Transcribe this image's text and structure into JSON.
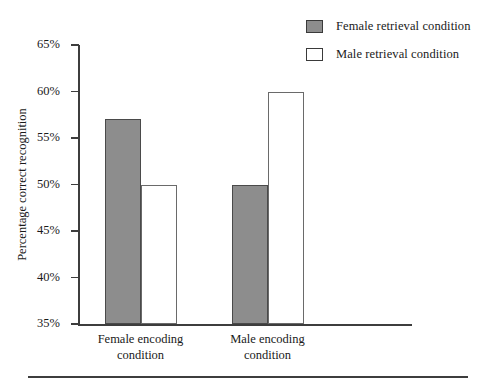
{
  "chart_data": {
    "type": "bar",
    "title": "",
    "xlabel": "",
    "ylabel": "Percentage correct recognition",
    "categories": [
      "Female encoding condition",
      "Male encoding condition"
    ],
    "category_lines": [
      [
        "Female encoding",
        "condition"
      ],
      [
        "Male encoding",
        "condition"
      ]
    ],
    "series": [
      {
        "name": "Female retrieval condition",
        "values": [
          57,
          50
        ],
        "color": "#8d8d8d"
      },
      {
        "name": "Male retrieval condition",
        "values": [
          50,
          60
        ],
        "color": "#ffffff"
      }
    ],
    "ylim": [
      35,
      65
    ],
    "ytick_values": [
      65,
      60,
      55,
      50,
      45,
      40,
      35
    ],
    "ytick_labels": [
      "65%",
      "60%",
      "55%",
      "50%",
      "45%",
      "40%",
      "35%"
    ],
    "grid": false,
    "legend_position": "top-right",
    "value_unit": "%"
  },
  "legend": {
    "items": [
      {
        "label": "Female retrieval condition",
        "swatch": "filled-gray-square"
      },
      {
        "label": "Male retrieval condition",
        "swatch": "hollow-white-square"
      }
    ]
  },
  "axes": {
    "y_title": "Percentage correct recognition",
    "y_ticks": [
      "65%",
      "60%",
      "55%",
      "50%",
      "45%",
      "40%",
      "35%"
    ],
    "x_groups": [
      {
        "line1": "Female encoding",
        "line2": "condition"
      },
      {
        "line1": "Male encoding",
        "line2": "condition"
      }
    ]
  },
  "artifacts": {
    "top_cropped_text": ""
  }
}
